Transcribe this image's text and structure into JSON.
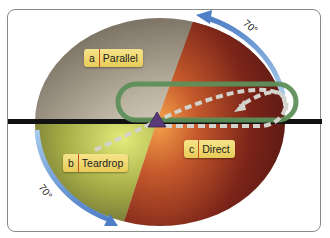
{
  "diagram": {
    "type": "holding-pattern-entry-sectors",
    "colors": {
      "parallel_sector": "#b7ae9c",
      "teardrop_sector": "#a9b04a",
      "direct_sector": "#7a2418",
      "holding_track": "#5e8f5a",
      "arc_arrow": "#5b86c8",
      "fix_marker": "#5a3a7a",
      "inbound_line": "#111111",
      "path_dashes": "#cfcfc8",
      "label_bg": "#f2dc78"
    },
    "labels": {
      "a": {
        "letter": "a",
        "text": "Parallel"
      },
      "b": {
        "letter": "b",
        "text": "Teardrop"
      },
      "c": {
        "letter": "c",
        "text": "Direct"
      }
    },
    "angles": {
      "top": "70°",
      "bottom": "70°"
    }
  }
}
